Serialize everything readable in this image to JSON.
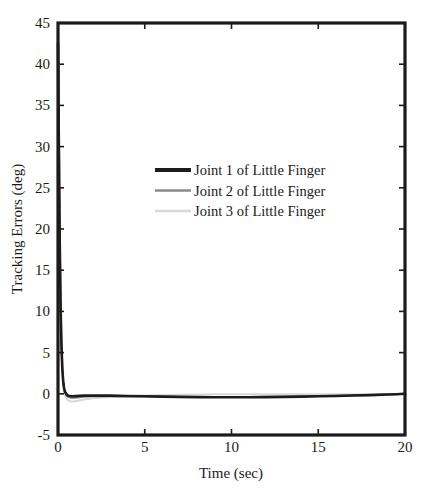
{
  "chart_data": {
    "type": "line",
    "title": "",
    "xlabel": "Time (sec)",
    "ylabel": "Tracking Errors (deg)",
    "xlim": [
      0,
      20
    ],
    "ylim": [
      -5,
      45
    ],
    "xticks": [
      0,
      5,
      10,
      15,
      20
    ],
    "yticks": [
      -5,
      0,
      5,
      10,
      15,
      20,
      25,
      30,
      35,
      40,
      45
    ],
    "xticklabels": [
      "0",
      "5",
      "10",
      "15",
      "20"
    ],
    "yticklabels": [
      "-5",
      "0",
      "5",
      "10",
      "15",
      "20",
      "25",
      "30",
      "35",
      "40",
      "45"
    ],
    "grid": false,
    "legend_position": "upper center",
    "colors": {
      "joint1": "#1c1c1c",
      "joint2": "#8a8a8a",
      "joint3": "#d8d8d8",
      "axis": "#1b1b1b",
      "background": "#ffffff"
    },
    "series": [
      {
        "name": "Joint 1 of Little Finger",
        "color": "#1c1c1c",
        "x": [
          0,
          0.05,
          0.1,
          0.15,
          0.2,
          0.25,
          0.3,
          0.35,
          0.4,
          0.5,
          0.6,
          0.8,
          1.0,
          1.5,
          2.0,
          3.0,
          4.0,
          5.0,
          6.0,
          7.0,
          8.0,
          9.0,
          10.0,
          11.0,
          12.0,
          13.0,
          14.0,
          15.0,
          16.0,
          17.0,
          18.0,
          19.0,
          19.5,
          20.0
        ],
        "y": [
          42.5,
          30.0,
          18.5,
          10.5,
          5.8,
          3.0,
          1.5,
          0.7,
          0.25,
          -0.1,
          -0.25,
          -0.3,
          -0.28,
          -0.22,
          -0.2,
          -0.22,
          -0.26,
          -0.3,
          -0.34,
          -0.37,
          -0.4,
          -0.41,
          -0.42,
          -0.41,
          -0.4,
          -0.37,
          -0.34,
          -0.3,
          -0.26,
          -0.21,
          -0.16,
          -0.09,
          -0.05,
          0.0
        ]
      },
      {
        "name": "Joint 2 of Little Finger",
        "color": "#8a8a8a",
        "x": [
          0,
          0.05,
          0.1,
          0.15,
          0.2,
          0.25,
          0.3,
          0.35,
          0.4,
          0.5,
          0.6,
          0.8,
          1.0,
          1.5,
          2.0,
          3.0,
          4.0,
          5.0,
          6.0,
          7.0,
          8.0,
          9.0,
          10.0,
          11.0,
          12.0,
          13.0,
          14.0,
          15.0,
          16.0,
          17.0,
          18.0,
          19.0,
          19.5,
          20.0
        ],
        "y": [
          45.0,
          31.5,
          19.5,
          11.0,
          6.0,
          3.1,
          1.5,
          0.65,
          0.2,
          -0.2,
          -0.4,
          -0.5,
          -0.48,
          -0.35,
          -0.3,
          -0.3,
          -0.32,
          -0.34,
          -0.36,
          -0.38,
          -0.39,
          -0.4,
          -0.4,
          -0.39,
          -0.37,
          -0.35,
          -0.32,
          -0.28,
          -0.24,
          -0.19,
          -0.14,
          -0.08,
          -0.04,
          0.0
        ]
      },
      {
        "name": "Joint 3 of Little Finger",
        "color": "#d8d8d8",
        "x": [
          0,
          0.05,
          0.1,
          0.15,
          0.2,
          0.25,
          0.3,
          0.35,
          0.4,
          0.5,
          0.6,
          0.8,
          1.0,
          1.5,
          2.0,
          3.0,
          4.0,
          5.0,
          6.0,
          7.0,
          8.0,
          9.0,
          10.0,
          11.0,
          12.0,
          13.0,
          14.0,
          15.0,
          16.0,
          17.0,
          18.0,
          19.0,
          19.5,
          20.0
        ],
        "y": [
          43.0,
          29.0,
          17.0,
          9.5,
          5.0,
          2.4,
          1.0,
          0.25,
          -0.2,
          -0.65,
          -0.85,
          -0.95,
          -0.9,
          -0.7,
          -0.55,
          -0.4,
          -0.3,
          -0.22,
          -0.16,
          -0.12,
          -0.08,
          -0.06,
          -0.05,
          -0.05,
          -0.05,
          -0.05,
          -0.05,
          -0.05,
          -0.05,
          -0.05,
          -0.04,
          -0.02,
          -0.01,
          0.0
        ]
      }
    ],
    "legend_entries": [
      "Joint 1 of Little Finger",
      "Joint 2 of Little Finger",
      "Joint 3 of Little Finger"
    ]
  }
}
